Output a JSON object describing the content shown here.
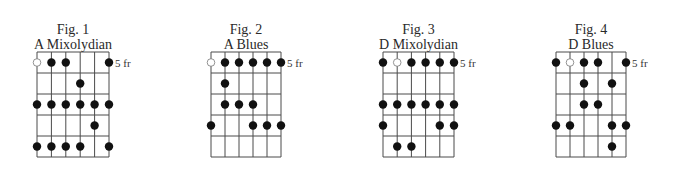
{
  "diagram": {
    "type": "scale-fretboard-diagrams",
    "strings": 6,
    "frets_shown": 5,
    "colors": {
      "line": "#4a4a4a",
      "dot": "#111111",
      "open_dot_fill": "#ffffff"
    }
  },
  "figures": [
    {
      "number_label": "Fig. 1",
      "name": "A Mixolydian",
      "fret_label": "5 fr",
      "grid_x": [
        37,
        109
      ],
      "rows": [
        [
          {
            "s": 1,
            "open": true
          },
          {
            "s": 2
          },
          {
            "s": 3
          },
          {
            "s": 6
          }
        ],
        [
          {
            "s": 4
          }
        ],
        [
          {
            "s": 1
          },
          {
            "s": 2
          },
          {
            "s": 3
          },
          {
            "s": 4
          },
          {
            "s": 5
          },
          {
            "s": 6
          }
        ],
        [
          {
            "s": 5
          }
        ],
        [
          {
            "s": 1
          },
          {
            "s": 2
          },
          {
            "s": 3
          },
          {
            "s": 4
          },
          {
            "s": 6
          }
        ]
      ]
    },
    {
      "number_label": "Fig. 2",
      "name": "A Blues",
      "fret_label": "5 fr",
      "grid_x": [
        211,
        281
      ],
      "rows": [
        [
          {
            "s": 1,
            "open": true
          },
          {
            "s": 2
          },
          {
            "s": 3
          },
          {
            "s": 4
          },
          {
            "s": 5
          },
          {
            "s": 6
          }
        ],
        [
          {
            "s": 2
          }
        ],
        [
          {
            "s": 2
          },
          {
            "s": 3
          },
          {
            "s": 4
          }
        ],
        [
          {
            "s": 1
          },
          {
            "s": 4
          },
          {
            "s": 5
          },
          {
            "s": 6
          }
        ],
        []
      ]
    },
    {
      "number_label": "Fig. 3",
      "name": "D Mixolydian",
      "fret_label": "5 fr",
      "grid_x": [
        383,
        454
      ],
      "rows": [
        [
          {
            "s": 1
          },
          {
            "s": 2,
            "open": true
          },
          {
            "s": 3
          },
          {
            "s": 4
          },
          {
            "s": 5
          },
          {
            "s": 6
          }
        ],
        [],
        [
          {
            "s": 1
          },
          {
            "s": 2
          },
          {
            "s": 3
          },
          {
            "s": 4
          },
          {
            "s": 5
          },
          {
            "s": 6
          }
        ],
        [
          {
            "s": 1
          },
          {
            "s": 5
          },
          {
            "s": 6
          }
        ],
        [
          {
            "s": 2
          },
          {
            "s": 3
          }
        ]
      ]
    },
    {
      "number_label": "Fig. 4",
      "name": "D Blues",
      "fret_label": "5 fr",
      "grid_x": [
        556,
        626
      ],
      "rows": [
        [
          {
            "s": 1
          },
          {
            "s": 2,
            "open": true
          },
          {
            "s": 3
          },
          {
            "s": 4
          },
          {
            "s": 6
          }
        ],
        [
          {
            "s": 3
          },
          {
            "s": 5
          }
        ],
        [
          {
            "s": 3
          },
          {
            "s": 4
          }
        ],
        [
          {
            "s": 1
          },
          {
            "s": 2
          },
          {
            "s": 5
          },
          {
            "s": 6
          }
        ],
        [
          {
            "s": 5
          }
        ]
      ]
    }
  ]
}
